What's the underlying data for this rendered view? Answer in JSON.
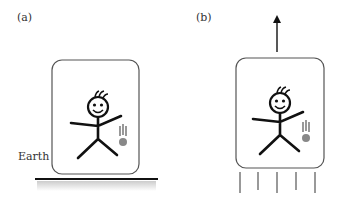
{
  "panels": [
    {
      "label": "(a)",
      "caption": "Earth"
    },
    {
      "label": "(b)"
    }
  ]
}
